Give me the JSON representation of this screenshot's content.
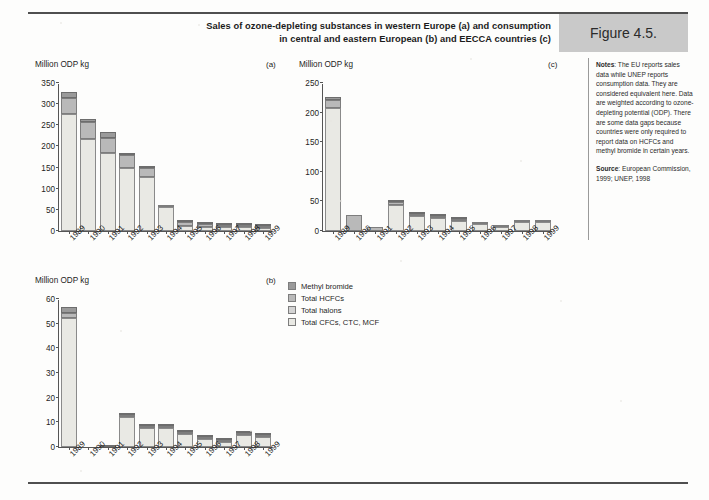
{
  "header": {
    "title": "Sales of ozone-depleting substances in western Europe (a) and consumption in central and eastern European (b) and EECCA countries (c)",
    "title_line1": "Sales of ozone-depleting substances in western Europe (a) and consumption",
    "title_line2": "in central and eastern European (b) and EECCA countries (c)",
    "figure_label": "Figure 4.5."
  },
  "notes": {
    "notes_label": "Notes",
    "notes_text": ": The EU reports sales data while UNEP reports consumption data. They are considered equivalent here. Data are weighted according to ozone-depleting potential (ODP). There are some data gaps because countries were only required to report data on HCFCs and methyl bromide in certain years.",
    "source_label": "Source",
    "source_text": ": European Commission, 1999; UNEP, 1998"
  },
  "legend": {
    "items": [
      {
        "label": "Methyl bromide",
        "color": "#9a9a9a"
      },
      {
        "label": "Total HCFCs",
        "color": "#b9b9b9"
      },
      {
        "label": "Total halons",
        "color": "#d4d4d4"
      },
      {
        "label": "Total CFCs, CTC, MCF",
        "color": "#e9e9e4"
      }
    ]
  },
  "chart_data": [
    {
      "id": "a",
      "type": "bar",
      "stacked": true,
      "panel_letter": "(a)",
      "title": "Sales of ozone-depleting substances in western Europe",
      "ylabel": "Million ODP kg",
      "xlabel": "",
      "ylim": [
        0,
        350
      ],
      "yticks": [
        0,
        50,
        100,
        150,
        200,
        250,
        300,
        350
      ],
      "grid": false,
      "legend_position": "external-center",
      "categories": [
        "1989",
        "1990",
        "1991",
        "1992",
        "1993",
        "1994",
        "1995",
        "1996",
        "1997",
        "1998",
        "1999"
      ],
      "series": [
        {
          "name": "Total CFCs, CTC, MCF",
          "color": "#e9e9e4",
          "values": [
            277,
            217,
            184,
            151,
            130,
            60,
            13,
            10,
            10,
            11,
            8
          ]
        },
        {
          "name": "Total halons",
          "color": "#d4d4d4",
          "values": [
            0,
            0,
            0,
            0,
            0,
            0,
            0,
            0,
            0,
            0,
            0
          ]
        },
        {
          "name": "Total HCFCs",
          "color": "#b9b9b9",
          "values": [
            38,
            41,
            36,
            30,
            22,
            1,
            9,
            7,
            6,
            6,
            7
          ]
        },
        {
          "name": "Methyl bromide",
          "color": "#9a9a9a",
          "values": [
            14,
            6,
            15,
            3,
            2,
            0,
            4,
            4,
            3,
            2,
            2
          ]
        }
      ],
      "totals": [
        329,
        264,
        235,
        184,
        154,
        61,
        26,
        21,
        19,
        19,
        17
      ]
    },
    {
      "id": "b",
      "type": "bar",
      "stacked": true,
      "panel_letter": "(b)",
      "title": "Consumption in central and eastern European countries",
      "ylabel": "Million ODP kg",
      "xlabel": "",
      "ylim": [
        0,
        60
      ],
      "yticks": [
        0,
        10,
        20,
        30,
        40,
        50,
        60
      ],
      "grid": false,
      "categories": [
        "1989",
        "1990",
        "1991",
        "1992",
        "1993",
        "1994",
        "1995",
        "1996",
        "1997",
        "1998",
        "1999"
      ],
      "series": [
        {
          "name": "Total CFCs, CTC, MCF",
          "color": "#e9e9e4",
          "values": [
            52.3,
            0,
            0,
            12.3,
            8.7,
            8.8,
            6.2,
            4.2,
            3.3,
            5.8,
            4.8
          ]
        },
        {
          "name": "Total halons",
          "color": "#d4d4d4",
          "values": [
            0,
            0,
            0,
            0,
            0,
            0,
            0,
            0,
            0,
            0,
            0
          ]
        },
        {
          "name": "Total HCFCs",
          "color": "#b9b9b9",
          "values": [
            2.0,
            0,
            0,
            0.8,
            0.5,
            0.4,
            0.5,
            0.3,
            0.3,
            0.5,
            0.5
          ]
        },
        {
          "name": "Methyl bromide",
          "color": "#9a9a9a",
          "values": [
            2.4,
            0,
            0.2,
            0.5,
            0.2,
            0.2,
            0.3,
            0.2,
            0.2,
            0.3,
            0.2
          ]
        }
      ],
      "totals": [
        56.7,
        0,
        0.2,
        13.6,
        9.4,
        9.4,
        7.0,
        4.7,
        3.8,
        6.6,
        5.5
      ],
      "data_gaps": [
        "1990",
        "1991"
      ]
    },
    {
      "id": "c",
      "type": "bar",
      "stacked": true,
      "panel_letter": "(c)",
      "title": "Consumption in EECCA countries",
      "ylabel": "Million ODP kg",
      "xlabel": "",
      "ylim": [
        0,
        250
      ],
      "yticks": [
        0,
        50,
        100,
        150,
        200,
        250
      ],
      "grid": false,
      "categories": [
        "1989",
        "1990",
        "1991",
        "1992",
        "1993",
        "1994",
        "1995",
        "1996",
        "1997",
        "1998",
        "1999"
      ],
      "series": [
        {
          "name": "Total CFCs, CTC, MCF",
          "color": "#e9e9e4",
          "values": [
            207,
            0,
            0,
            44,
            29,
            25,
            21,
            14,
            9,
            17,
            17
          ]
        },
        {
          "name": "Total halons",
          "color": "#d4d4d4",
          "values": [
            0,
            0,
            0,
            0,
            0,
            0,
            0,
            0,
            0,
            0,
            0
          ]
        },
        {
          "name": "Total HCFCs",
          "color": "#b9b9b9",
          "values": [
            14,
            27,
            7,
            6,
            1,
            1,
            1,
            1,
            1,
            1,
            1
          ]
        },
        {
          "name": "Methyl bromide",
          "color": "#9a9a9a",
          "values": [
            5,
            0,
            0,
            3,
            2,
            2,
            2,
            0,
            0,
            0,
            0
          ]
        }
      ],
      "totals": [
        226,
        27,
        7,
        53,
        32,
        28,
        24,
        15,
        10,
        18,
        18
      ]
    }
  ]
}
